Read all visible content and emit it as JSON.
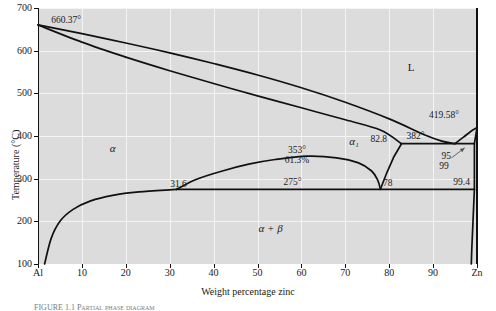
{
  "figure": {
    "caption": "FIGURE 1.1  Partial phase diagram",
    "background_color": "#dcdcdc",
    "grid_color": "#f4f4f4",
    "line_color": "#111111"
  },
  "axes": {
    "y_title": "Temperature (°C)",
    "x_title": "Weight percentage zinc",
    "y_ticks": [
      "100",
      "200",
      "300",
      "400",
      "500",
      "600",
      "700"
    ],
    "y_values": [
      100,
      200,
      300,
      400,
      500,
      600,
      700
    ],
    "x_ticks": [
      "Al",
      "10",
      "20",
      "30",
      "40",
      "50",
      "60",
      "70",
      "80",
      "90",
      "Zn"
    ],
    "x_values": [
      0,
      10,
      20,
      30,
      40,
      50,
      60,
      70,
      80,
      90,
      100
    ],
    "xlim": [
      0,
      100
    ],
    "ylim": [
      100,
      700
    ],
    "grid": true
  },
  "regions": [
    {
      "label": "L",
      "x": 85,
      "y": 560
    },
    {
      "label": "α",
      "x": 17,
      "y": 370
    },
    {
      "label": "α₁",
      "x": 72,
      "y": 385
    },
    {
      "label": "α + β",
      "x": 53,
      "y": 182
    }
  ],
  "annotations": [
    {
      "text": "660.37°",
      "x": 3,
      "y": 672,
      "anchor": "start"
    },
    {
      "text": "419.58°",
      "x": 92.5,
      "y": 450,
      "anchor": "middle"
    },
    {
      "text": "382°",
      "x": 86,
      "y": 400,
      "anchor": "middle"
    },
    {
      "text": "353°",
      "x": 59,
      "y": 368,
      "anchor": "middle"
    },
    {
      "text": "61.3%",
      "x": 59,
      "y": 344,
      "anchor": "middle"
    },
    {
      "text": "275°",
      "x": 58,
      "y": 292,
      "anchor": "middle"
    },
    {
      "text": "82.8",
      "x": 79.5,
      "y": 392,
      "anchor": "end"
    },
    {
      "text": "78",
      "x": 78.6,
      "y": 290,
      "anchor": "start"
    },
    {
      "text": "31.6",
      "x": 32,
      "y": 288,
      "anchor": "middle"
    },
    {
      "text": "95",
      "x": 93,
      "y": 352,
      "anchor": "middle"
    },
    {
      "text": "99",
      "x": 92.5,
      "y": 330,
      "anchor": "middle"
    },
    {
      "text": "99.4",
      "x": 96.5,
      "y": 292,
      "anchor": "middle"
    }
  ],
  "chart_data": {
    "type": "line",
    "xlabel": "Weight percentage zinc",
    "ylabel": "Temperature (°C)",
    "xlim": [
      0,
      100
    ],
    "ylim": [
      100,
      700
    ],
    "grid": true,
    "legend": "none",
    "invariant_points": [
      {
        "name": "Al melting point",
        "composition": 0,
        "temperature": 660.37
      },
      {
        "name": "Zn melting point",
        "composition": 100,
        "temperature": 419.58
      },
      {
        "name": "Eutectic (382°)",
        "composition": 95,
        "temperature": 382
      },
      {
        "name": "Eutectic liquid / alpha1 limit",
        "composition": 82.8,
        "temperature": 382
      },
      {
        "name": "Eutectic solid solubility",
        "composition": 99,
        "temperature": 382
      },
      {
        "name": "Monotectoid dome apex",
        "composition": 61.3,
        "temperature": 353
      },
      {
        "name": "Eutectoid (275°)",
        "composition": 78,
        "temperature": 275
      },
      {
        "name": "Eutectoid alpha limit",
        "composition": 31.6,
        "temperature": 275
      },
      {
        "name": "Eutectoid beta limit",
        "composition": 99.4,
        "temperature": 275
      }
    ],
    "series": [
      {
        "name": "liquidus",
        "points": [
          [
            0,
            660.37
          ],
          [
            10,
            640
          ],
          [
            20,
            618
          ],
          [
            30,
            595
          ],
          [
            40,
            570
          ],
          [
            50,
            543
          ],
          [
            60,
            513
          ],
          [
            70,
            479
          ],
          [
            80,
            440
          ],
          [
            88,
            403
          ],
          [
            92,
            388
          ],
          [
            95,
            382
          ]
        ]
      },
      {
        "name": "solidus",
        "points": [
          [
            0,
            660.37
          ],
          [
            10,
            620
          ],
          [
            20,
            585
          ],
          [
            30,
            553
          ],
          [
            40,
            523
          ],
          [
            50,
            494
          ],
          [
            60,
            466
          ],
          [
            70,
            438
          ],
          [
            78,
            414
          ],
          [
            82.8,
            382
          ]
        ]
      },
      {
        "name": "zinc-liquidus",
        "points": [
          [
            95,
            382
          ],
          [
            97,
            398
          ],
          [
            98.5,
            410
          ],
          [
            100,
            419.58
          ]
        ]
      },
      {
        "name": "zinc-solidus-beta",
        "points": [
          [
            100,
            419.58
          ],
          [
            99.4,
            382
          ],
          [
            99.4,
            275
          ]
        ]
      },
      {
        "name": "beta-boundary-right",
        "points": [
          [
            99.4,
            275
          ],
          [
            99.1,
            200
          ],
          [
            98.8,
            130
          ],
          [
            98.7,
            100
          ]
        ]
      },
      {
        "name": "alpha1-right-boundary",
        "points": [
          [
            82.8,
            382
          ],
          [
            81,
            350
          ],
          [
            79.5,
            315
          ],
          [
            78,
            275
          ]
        ]
      },
      {
        "name": "miscibility-dome",
        "points": [
          [
            31.6,
            275
          ],
          [
            36,
            298
          ],
          [
            42,
            318
          ],
          [
            48,
            334
          ],
          [
            54,
            345
          ],
          [
            61.3,
            353
          ],
          [
            68,
            349
          ],
          [
            73,
            337
          ],
          [
            76,
            318
          ],
          [
            77.4,
            296
          ],
          [
            78,
            275
          ]
        ]
      },
      {
        "name": "alpha-solvus",
        "points": [
          [
            1.5,
            100
          ],
          [
            3,
            160
          ],
          [
            5,
            200
          ],
          [
            8,
            228
          ],
          [
            12,
            248
          ],
          [
            17,
            261
          ],
          [
            23,
            269
          ],
          [
            31.6,
            275
          ]
        ]
      },
      {
        "name": "eutectoid-horizontal-275",
        "points": [
          [
            31.6,
            275
          ],
          [
            78,
            275
          ],
          [
            99.4,
            275
          ]
        ]
      },
      {
        "name": "eutectic-horizontal-382",
        "points": [
          [
            82.8,
            382
          ],
          [
            95,
            382
          ],
          [
            99.4,
            382
          ]
        ]
      }
    ]
  },
  "leaders": [
    {
      "from": [
        94.2,
        349
      ],
      "to": [
        97.2,
        372
      ]
    }
  ]
}
